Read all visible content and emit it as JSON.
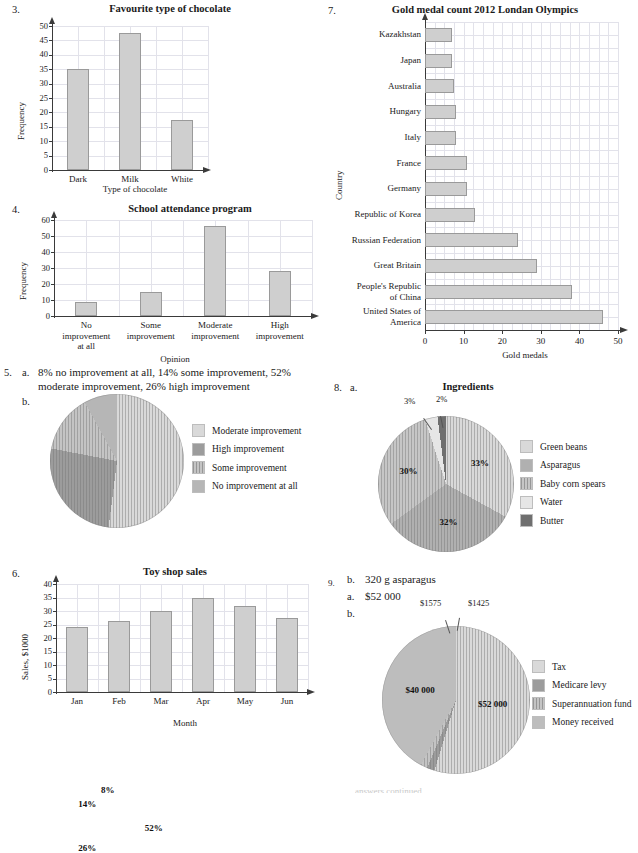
{
  "page": {
    "width": 638,
    "height": 794,
    "bottom_sliver_text": "answers continued"
  },
  "palette": {
    "bar_fill": "#cfcfcf",
    "bar_stroke": "#9a9a9a",
    "grid": "#e2e2ea",
    "axis": "#3a3a3a",
    "pie_light": "#d9d9d9",
    "pie_medium": "#b6b6b6",
    "pie_dark": "#9c9c9c",
    "pie_darkest": "#6f6f6f",
    "pie_lightest": "#e6e6e6"
  },
  "q3": {
    "number": "3.",
    "chart_data": {
      "type": "bar",
      "title": "Favourite type of chocolate",
      "xlabel": "Type of chocolate",
      "ylabel": "Frequency",
      "categories": [
        "Dark",
        "Milk",
        "White"
      ],
      "values": [
        35,
        47.5,
        17.5
      ],
      "ylim": [
        0,
        50
      ],
      "yticks": [
        0,
        5,
        10,
        15,
        20,
        25,
        30,
        35,
        40,
        45,
        50
      ],
      "grid": true,
      "legend": "none"
    }
  },
  "q4": {
    "number": "4.",
    "chart_data": {
      "type": "bar",
      "title": "School attendance program",
      "xlabel": "Opinion",
      "ylabel": "Frequency",
      "categories": [
        "No improvement at all",
        "Some improvement",
        "Moderate improvement",
        "High improvement"
      ],
      "category_lines": [
        [
          "No",
          "improvement",
          "at all"
        ],
        [
          "Some",
          "improvement"
        ],
        [
          "Moderate",
          "improvement"
        ],
        [
          "High",
          "improvement"
        ]
      ],
      "values": [
        9,
        15,
        56,
        28
      ],
      "ylim": [
        0,
        60
      ],
      "yticks": [
        0,
        10,
        20,
        30,
        40,
        50,
        60
      ],
      "grid": true,
      "legend": "none"
    }
  },
  "q5": {
    "number": "5.",
    "part_a_label": "a.",
    "part_a_text": "8% no improvement at all, 14% some improvement, 52% moderate improvement, 26% high improvement",
    "part_b_label": "b.",
    "chart_data": {
      "type": "pie",
      "title": "",
      "labels": [
        "Moderate improvement",
        "High improvement",
        "Some improvement",
        "No improvement at all"
      ],
      "values": [
        52,
        26,
        14,
        8
      ],
      "slice_labels": [
        "52%",
        "26%",
        "14%",
        "8%"
      ],
      "colors": [
        "#d9d9d9",
        "#9c9c9c",
        "#c4c4c4",
        "#b6b6b6"
      ],
      "hatched": [
        false,
        false,
        true,
        false
      ],
      "start_angle_deg": 0,
      "direction": "clockwise",
      "legend_position": "right"
    }
  },
  "q6": {
    "number": "6.",
    "chart_data": {
      "type": "bar",
      "title": "Toy shop sales",
      "xlabel": "Month",
      "ylabel": "Sales, $1000",
      "categories": [
        "Jan",
        "Feb",
        "Mar",
        "Apr",
        "May",
        "Jun"
      ],
      "values": [
        24,
        26.3,
        30,
        35,
        32,
        27.3
      ],
      "ylim": [
        0,
        40
      ],
      "yticks": [
        0,
        5,
        10,
        15,
        20,
        25,
        30,
        35,
        40
      ],
      "grid": true,
      "legend": "none"
    }
  },
  "q7": {
    "number": "7.",
    "chart_data": {
      "type": "bar",
      "orientation": "horizontal",
      "title": "Gold medal count 2012 Londan Olympics",
      "xlabel": "Gold medals",
      "ylabel": "Country",
      "categories": [
        "Kazakhstan",
        "Japan",
        "Australia",
        "Hungary",
        "Italy",
        "France",
        "Germany",
        "Republic of Korea",
        "Russian Federation",
        "Great Britain",
        "People's Republic of China",
        "United States of America"
      ],
      "category_lines": [
        [
          "Kazakhstan"
        ],
        [
          "Japan"
        ],
        [
          "Australia"
        ],
        [
          "Hungary"
        ],
        [
          "Italy"
        ],
        [
          "France"
        ],
        [
          "Germany"
        ],
        [
          "Republic of Korea"
        ],
        [
          "Russian Federation"
        ],
        [
          "Great Britain"
        ],
        [
          "People's Republic",
          "of China"
        ],
        [
          "United States of",
          "America"
        ]
      ],
      "values": [
        7,
        7,
        7.5,
        8,
        8,
        11,
        11,
        13,
        24,
        29,
        38,
        46
      ],
      "xlim": [
        0,
        50
      ],
      "xticks": [
        0,
        10,
        20,
        30,
        40,
        50
      ],
      "grid": true,
      "legend": "none"
    }
  },
  "q8": {
    "number": "8.",
    "part_a_label": "a.",
    "chart_data": {
      "type": "pie",
      "title": "Ingredients",
      "labels": [
        "Green beans",
        "Asparagus",
        "Baby corn spears",
        "Water",
        "Butter"
      ],
      "values": [
        33,
        32,
        30,
        3,
        2
      ],
      "slice_labels": [
        "33%",
        "32%",
        "30%",
        "3%",
        "2%"
      ],
      "colors": [
        "#d9d9d9",
        "#b0b0b0",
        "#c6c6c6",
        "#e6e6e6",
        "#6f6f6f"
      ],
      "hatched": [
        false,
        false,
        true,
        false,
        false
      ],
      "callouts": [
        "3%",
        "2%"
      ],
      "start_angle_deg": 0,
      "direction": "clockwise",
      "legend_position": "right"
    }
  },
  "q9": {
    "number": "9.",
    "part_b_top_label": "b.",
    "part_b_top_text": "320 g asparagus",
    "part_a_label": "a.",
    "part_a_text": "$52 000",
    "part_b_label": "b.",
    "chart_data": {
      "type": "pie",
      "title": "",
      "labels": [
        "Tax",
        "Medicare levy",
        "Superannuation fund",
        "Money received"
      ],
      "values": [
        52000,
        1575,
        1425,
        40000
      ],
      "slice_labels": [
        "$52 000",
        "$1575",
        "$1425",
        "$40 000"
      ],
      "colors": [
        "#d9d9d9",
        "#9c9c9c",
        "#c4c4c4",
        "#bdbdbd"
      ],
      "hatched": [
        false,
        false,
        true,
        false
      ],
      "callouts": [
        "$1575",
        "$1425"
      ],
      "start_angle_deg": 0,
      "direction": "clockwise",
      "legend_position": "right"
    }
  }
}
